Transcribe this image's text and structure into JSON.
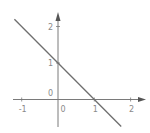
{
  "chart_data": {
    "type": "line",
    "title": "",
    "xlabel": "",
    "ylabel": "",
    "xlim": [
      -1.1,
      2.4
    ],
    "ylim": [
      -0.8,
      2.4
    ],
    "grid": false,
    "legend": null,
    "axes_style": "cartesian-arrows",
    "x_ticks": [
      -1,
      0,
      1,
      2
    ],
    "x_tick_labels": [
      "-1",
      "0",
      "1",
      "2"
    ],
    "y_ticks": [
      0,
      1,
      2
    ],
    "y_tick_labels": [
      "0",
      "1",
      "2"
    ],
    "series": [
      {
        "name": "line",
        "equation": "y = -x + 1",
        "x": [
          -1.2,
          1.74
        ],
        "y": [
          2.2,
          -0.74
        ],
        "color": "#6e6e6e"
      }
    ],
    "annotations": []
  },
  "colors": {
    "axis": "#7a7a7a",
    "line": "#6e6e6e",
    "label": "#8a8a8a",
    "background": "#ffffff"
  }
}
